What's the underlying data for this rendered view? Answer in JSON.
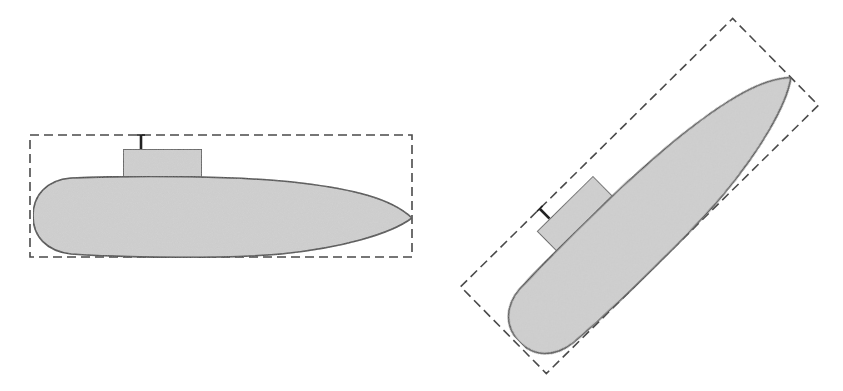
{
  "figure": {
    "width": 843,
    "height": 391,
    "background": "#ffffff",
    "colors": {
      "hull_fill": "#d2d2d2",
      "outline": "#3a3a3a",
      "bbox_stroke": "#4a4a4a"
    },
    "objects": [
      {
        "id": "submarine-axis-aligned",
        "label": "",
        "center": [
          221,
          196
        ],
        "rotation_deg": 0,
        "bbox": {
          "width": 382,
          "height": 122,
          "style": "dashed"
        }
      },
      {
        "id": "submarine-rotated",
        "label": "",
        "center": [
          639.5,
          196
        ],
        "rotation_deg": -44.6,
        "bbox": {
          "width": 382,
          "height": 122,
          "style": "dashed"
        }
      }
    ]
  }
}
